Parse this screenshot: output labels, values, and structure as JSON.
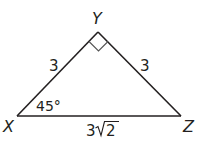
{
  "diagram": {
    "type": "right-isosceles-triangle",
    "colors": {
      "stroke": "#231f20",
      "marker": "#555555",
      "background": "#ffffff"
    },
    "vertices": {
      "X": {
        "label": "X",
        "x": 17,
        "y": 116
      },
      "Y": {
        "label": "Y",
        "x": 98,
        "y": 32
      },
      "Z": {
        "label": "Z",
        "x": 181,
        "y": 116
      }
    },
    "sides": {
      "XY": {
        "label": "3"
      },
      "YZ": {
        "label": "3"
      },
      "XZ": {
        "label_coef": "3",
        "label_radicand": "2"
      }
    },
    "angles": {
      "X": {
        "label": "45°"
      },
      "Y": {
        "right_angle_marker": true
      }
    }
  }
}
